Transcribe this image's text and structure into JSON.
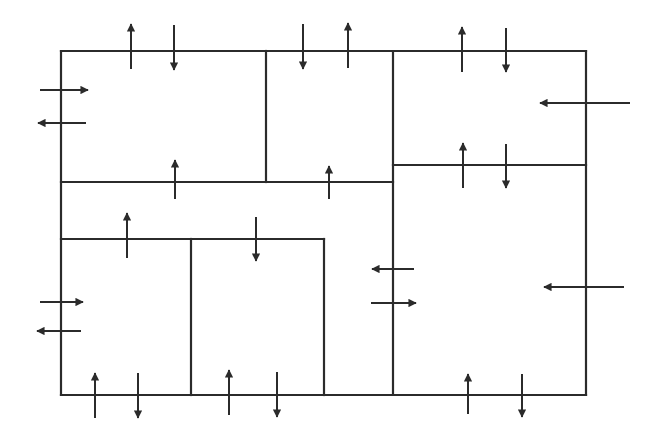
{
  "diagram": {
    "title": "",
    "stroke_color": "#2b2b2b",
    "background": "#ffffff",
    "walls": [
      {
        "id": "outer-top",
        "x1": 61,
        "y1": 51,
        "x2": 586,
        "y2": 51
      },
      {
        "id": "outer-bottom",
        "x1": 61,
        "y1": 395,
        "x2": 586,
        "y2": 395
      },
      {
        "id": "outer-left",
        "x1": 61,
        "y1": 51,
        "x2": 61,
        "y2": 395
      },
      {
        "id": "outer-right",
        "x1": 586,
        "y1": 51,
        "x2": 586,
        "y2": 395
      },
      {
        "id": "upper-left-divider",
        "x1": 266,
        "y1": 51,
        "x2": 266,
        "y2": 182
      },
      {
        "id": "left-horizontal",
        "x1": 61,
        "y1": 182,
        "x2": 393,
        "y2": 182
      },
      {
        "id": "center-vertical",
        "x1": 393,
        "y1": 51,
        "x2": 393,
        "y2": 395
      },
      {
        "id": "right-horizontal",
        "x1": 393,
        "y1": 165,
        "x2": 586,
        "y2": 165
      },
      {
        "id": "lower-horizontal",
        "x1": 61,
        "y1": 239,
        "x2": 324,
        "y2": 239
      },
      {
        "id": "lower-divider-1",
        "x1": 191,
        "y1": 239,
        "x2": 191,
        "y2": 395
      },
      {
        "id": "lower-divider-2",
        "x1": 324,
        "y1": 239,
        "x2": 324,
        "y2": 395
      }
    ],
    "arrows": [
      {
        "id": "top-1-up",
        "x1": 131,
        "y1": 69,
        "x2": 131,
        "y2": 24
      },
      {
        "id": "top-1-down",
        "x1": 174,
        "y1": 25,
        "x2": 174,
        "y2": 70
      },
      {
        "id": "top-2-down",
        "x1": 303,
        "y1": 24,
        "x2": 303,
        "y2": 69
      },
      {
        "id": "top-2-up",
        "x1": 348,
        "y1": 68,
        "x2": 348,
        "y2": 23
      },
      {
        "id": "top-3-up",
        "x1": 462,
        "y1": 72,
        "x2": 462,
        "y2": 27
      },
      {
        "id": "top-3-down",
        "x1": 506,
        "y1": 28,
        "x2": 506,
        "y2": 72
      },
      {
        "id": "left-1-right",
        "x1": 40,
        "y1": 90,
        "x2": 88,
        "y2": 90
      },
      {
        "id": "left-1-left",
        "x1": 86,
        "y1": 123,
        "x2": 38,
        "y2": 123
      },
      {
        "id": "right-1-left",
        "x1": 630,
        "y1": 103,
        "x2": 540,
        "y2": 103
      },
      {
        "id": "mid-1-up",
        "x1": 175,
        "y1": 199,
        "x2": 175,
        "y2": 160
      },
      {
        "id": "mid-2-up",
        "x1": 329,
        "y1": 199,
        "x2": 329,
        "y2": 166
      },
      {
        "id": "right-mid-up",
        "x1": 463,
        "y1": 188,
        "x2": 463,
        "y2": 143
      },
      {
        "id": "right-mid-down",
        "x1": 506,
        "y1": 144,
        "x2": 506,
        "y2": 188
      },
      {
        "id": "lower-1-up",
        "x1": 127,
        "y1": 258,
        "x2": 127,
        "y2": 213
      },
      {
        "id": "lower-2-down",
        "x1": 256,
        "y1": 217,
        "x2": 256,
        "y2": 261
      },
      {
        "id": "left-2-right",
        "x1": 40,
        "y1": 302,
        "x2": 83,
        "y2": 302
      },
      {
        "id": "left-2-left",
        "x1": 81,
        "y1": 331,
        "x2": 37,
        "y2": 331
      },
      {
        "id": "center-left",
        "x1": 414,
        "y1": 269,
        "x2": 372,
        "y2": 269
      },
      {
        "id": "center-right",
        "x1": 371,
        "y1": 303,
        "x2": 416,
        "y2": 303
      },
      {
        "id": "right-2-left",
        "x1": 624,
        "y1": 287,
        "x2": 544,
        "y2": 287
      },
      {
        "id": "bottom-1-up",
        "x1": 95,
        "y1": 418,
        "x2": 95,
        "y2": 373
      },
      {
        "id": "bottom-1-down",
        "x1": 138,
        "y1": 373,
        "x2": 138,
        "y2": 418
      },
      {
        "id": "bottom-2-up",
        "x1": 229,
        "y1": 415,
        "x2": 229,
        "y2": 370
      },
      {
        "id": "bottom-2-down",
        "x1": 277,
        "y1": 372,
        "x2": 277,
        "y2": 417
      },
      {
        "id": "bottom-3-up",
        "x1": 468,
        "y1": 414,
        "x2": 468,
        "y2": 374
      },
      {
        "id": "bottom-3-down",
        "x1": 522,
        "y1": 374,
        "x2": 522,
        "y2": 417
      }
    ]
  }
}
